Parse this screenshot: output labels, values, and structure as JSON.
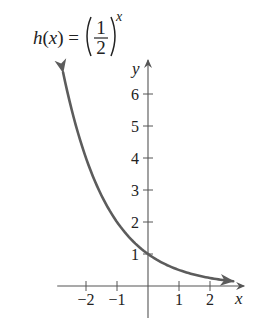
{
  "chart_data": {
    "type": "line",
    "title": {
      "func_name": "h",
      "var": "x",
      "equals": "=",
      "numerator": "1",
      "denominator": "2",
      "exponent": "x"
    },
    "function": "h(x) = (1/2)^x",
    "base": 0.5,
    "xlabel": "x",
    "ylabel": "y",
    "xlim": [
      -2.8,
      3.1
    ],
    "ylim": [
      -0.9,
      7.0
    ],
    "x_domain_drawn": [
      -2.74,
      2.75
    ],
    "x_ticks": [
      {
        "value": -2,
        "label": "−2"
      },
      {
        "value": -1,
        "label": "−1"
      },
      {
        "value": 1,
        "label": "1"
      },
      {
        "value": 2,
        "label": "2"
      }
    ],
    "y_ticks": [
      {
        "value": 1,
        "label": "1"
      },
      {
        "value": 2,
        "label": "2"
      },
      {
        "value": 3,
        "label": "3"
      },
      {
        "value": 4,
        "label": "4"
      },
      {
        "value": 5,
        "label": "5"
      },
      {
        "value": 6,
        "label": "6"
      }
    ],
    "series": [
      {
        "name": "h(x)",
        "points": [
          {
            "x": -2.74,
            "y": 6.68
          },
          {
            "x": -2,
            "y": 4
          },
          {
            "x": -1,
            "y": 2
          },
          {
            "x": 0,
            "y": 1
          },
          {
            "x": 1,
            "y": 0.5
          },
          {
            "x": 2,
            "y": 0.25
          },
          {
            "x": 2.75,
            "y": 0.15
          }
        ],
        "arrows_both_ends": true
      }
    ],
    "grid": false,
    "legend": "none",
    "colors": {
      "curve": "#5c5c5c",
      "axes": "#555555",
      "text": "#222222"
    }
  }
}
